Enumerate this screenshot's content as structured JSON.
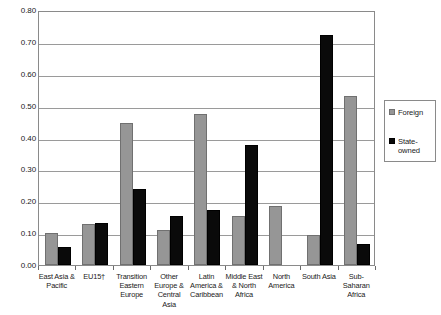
{
  "chart_data": {
    "type": "bar",
    "title": "",
    "xlabel": "",
    "ylabel": "",
    "ylim": [
      0.0,
      0.8
    ],
    "ytick_labels": [
      "0.80",
      "0.70",
      "0.60",
      "0.50",
      "0.40",
      "0.30",
      "0.20",
      "0.10",
      "0.00"
    ],
    "ytick_values": [
      0.8,
      0.7,
      0.6,
      0.5,
      0.4,
      0.3,
      0.2,
      0.1,
      0.0
    ],
    "grid": true,
    "legend_position": "right",
    "categories": [
      "East Asia & Pacific",
      "EU15†",
      "Transition Eastern Europe",
      "Other Europe & Central Asia",
      "Latin America & Caribbean",
      "Middle East & North Africa",
      "North America",
      "South Asia",
      "Sub-Saharan Africa"
    ],
    "category_lines": [
      [
        "East Asia &",
        "Pacific"
      ],
      [
        "EU15†"
      ],
      [
        "Transition",
        "Eastern",
        "Europe"
      ],
      [
        "Other",
        "Europe &",
        "Central",
        "Asia"
      ],
      [
        "Latin",
        "America &",
        "Caribbean"
      ],
      [
        "Middle East",
        "& North",
        "Africa"
      ],
      [
        "North",
        "America"
      ],
      [
        "South Asia"
      ],
      [
        "Sub-",
        "Saharan",
        "Africa"
      ]
    ],
    "series": [
      {
        "name": "Foreign",
        "color": "#969696",
        "values": [
          0.1,
          0.128,
          0.447,
          0.11,
          0.475,
          0.155,
          0.185,
          0.093,
          0.53
        ]
      },
      {
        "name": "State-owned",
        "color": "#0a0a0a",
        "values": [
          0.057,
          0.133,
          0.24,
          0.153,
          0.172,
          0.376,
          null,
          0.722,
          0.065
        ]
      }
    ]
  },
  "legend": {
    "entries": [
      {
        "label": "Foreign",
        "lines": [
          "Foreign"
        ],
        "swatch": "foreign"
      },
      {
        "label": "State-owned",
        "lines": [
          "State-",
          "owned"
        ],
        "swatch": "state"
      }
    ]
  }
}
